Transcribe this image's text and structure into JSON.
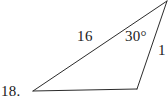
{
  "figure": {
    "type": "triangle-diagram",
    "background_color": "#ffffff",
    "stroke_color": "#2b2b2b",
    "stroke_width": 1,
    "labels": {
      "problem_number": "18.",
      "side_long": "16",
      "side_short": "1",
      "angle": "30°"
    },
    "vertices": {
      "left": {
        "x": 33,
        "y": 91
      },
      "bottom_right": {
        "x": 137,
        "y": 89
      },
      "apex": {
        "x": 167,
        "y": 1
      }
    },
    "edges": [
      {
        "name": "base-edge",
        "from": "left",
        "to": "bottom_right",
        "label": ""
      },
      {
        "name": "long-edge",
        "from": "left",
        "to": "apex",
        "label": "16"
      },
      {
        "name": "short-edge",
        "from": "bottom_right",
        "to": "apex",
        "label": "1"
      }
    ],
    "angle_marked_at": "apex",
    "angle_value_degrees": 30
  }
}
